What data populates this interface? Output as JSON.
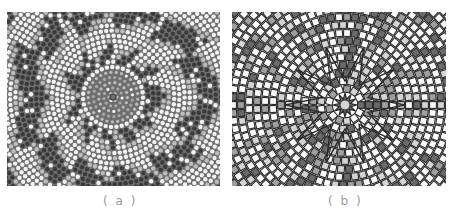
{
  "figure": {
    "panels": [
      {
        "id": "a",
        "label": "( a )",
        "description": "radial mosaic of dots (grayscale circles in concentric rings)",
        "center": [
          106,
          85
        ],
        "colors": {
          "background": "#6e6e6e",
          "dot_light": "#f2f2f2",
          "dot_mid": "#bdbdbd",
          "dot_dark": "#3a3a3a",
          "center_ring": "#a8a8a8"
        }
      },
      {
        "id": "b",
        "label": "( b )",
        "description": "radial tile mosaic with dark grid lines and star at center",
        "center": [
          113,
          93
        ],
        "colors": {
          "background": "#ffffff",
          "line": "#2a2a2a",
          "tile_light": "#d4d4d4",
          "tile_mid": "#a0a0a0",
          "tile_dark": "#6a6a6a",
          "tile_white": "#fafafa"
        }
      }
    ],
    "caption_fragment": "…"
  }
}
